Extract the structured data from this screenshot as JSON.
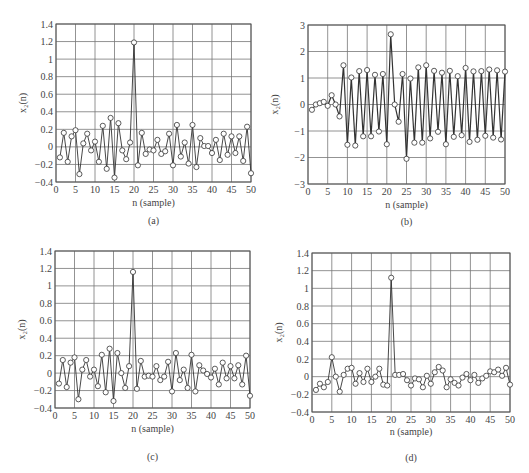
{
  "figure": {
    "panels": [
      "a",
      "b",
      "c",
      "d"
    ]
  },
  "chart_data": [
    {
      "id": "a",
      "type": "line",
      "panel_label": "(a)",
      "title": "",
      "xlabel": "n (sample)",
      "ylabel": "x₂(n)",
      "xlim": [
        0,
        50
      ],
      "ylim": [
        -0.4,
        1.4
      ],
      "xticks": [
        0,
        5,
        10,
        15,
        20,
        25,
        30,
        35,
        40,
        45,
        50
      ],
      "yticks": [
        -0.4,
        -0.2,
        0,
        0.2,
        0.4,
        0.6,
        0.8,
        1,
        1.2,
        1.4
      ],
      "ytick_labels": [
        "−0.4",
        "−0.2",
        "0",
        "0.2",
        "0.4",
        "0.6",
        "0.8",
        "1",
        "1.2",
        "1.4"
      ],
      "grid": true,
      "marker": "circle",
      "x": [
        1,
        2,
        3,
        4,
        5,
        6,
        7,
        8,
        9,
        10,
        11,
        12,
        13,
        14,
        15,
        16,
        17,
        18,
        19,
        20,
        21,
        22,
        23,
        24,
        25,
        26,
        27,
        28,
        29,
        30,
        31,
        32,
        33,
        34,
        35,
        36,
        37,
        38,
        39,
        40,
        41,
        42,
        43,
        44,
        45,
        46,
        47,
        48,
        49,
        50
      ],
      "values": [
        -0.12,
        0.16,
        -0.17,
        0.12,
        0.19,
        -0.31,
        0.04,
        0.15,
        -0.04,
        0.06,
        -0.17,
        0.24,
        -0.25,
        0.33,
        -0.35,
        0.27,
        -0.04,
        -0.14,
        0.05,
        1.19,
        -0.21,
        0.16,
        -0.08,
        -0.03,
        -0.04,
        0.08,
        -0.08,
        -0.05,
        0.15,
        -0.21,
        0.25,
        -0.11,
        0.05,
        -0.19,
        0.25,
        -0.23,
        0.1,
        0.01,
        0.01,
        -0.07,
        0.08,
        -0.15,
        0.15,
        -0.09,
        0.12,
        -0.07,
        0.12,
        -0.16,
        0.23,
        -0.3
      ]
    },
    {
      "id": "b",
      "type": "line",
      "panel_label": "(b)",
      "title": "",
      "xlabel": "n (sample)",
      "ylabel": "x₂(n)",
      "xlim": [
        0,
        50
      ],
      "ylim": [
        -3,
        3
      ],
      "xticks": [
        0,
        5,
        10,
        15,
        20,
        25,
        30,
        35,
        40,
        45,
        50
      ],
      "yticks": [
        -3,
        -2,
        -1,
        0,
        1,
        2,
        3
      ],
      "ytick_labels": [
        "−3",
        "−2",
        "−1",
        "0",
        "1",
        "2",
        "3"
      ],
      "grid": true,
      "marker": "circle",
      "x": [
        1,
        2,
        3,
        4,
        5,
        6,
        7,
        8,
        9,
        10,
        11,
        12,
        13,
        14,
        15,
        16,
        17,
        18,
        19,
        20,
        21,
        22,
        23,
        24,
        25,
        26,
        27,
        28,
        29,
        30,
        31,
        32,
        33,
        34,
        35,
        36,
        37,
        38,
        39,
        40,
        41,
        42,
        43,
        44,
        45,
        46,
        47,
        48,
        49,
        50
      ],
      "values": [
        -0.2,
        0.0,
        0.05,
        0.1,
        -0.05,
        0.35,
        0.0,
        -0.45,
        1.48,
        -1.52,
        1.02,
        -1.55,
        1.26,
        -1.2,
        1.3,
        -1.2,
        1.12,
        -1.02,
        1.15,
        -1.5,
        2.65,
        0.0,
        -0.65,
        1.15,
        -2.05,
        0.98,
        -1.44,
        1.4,
        -1.44,
        1.48,
        -1.28,
        1.27,
        -1.03,
        1.2,
        -1.5,
        1.27,
        -1.22,
        1.07,
        -1.16,
        1.38,
        -1.41,
        1.25,
        -1.33,
        1.26,
        -1.18,
        1.32,
        -1.25,
        1.29,
        -1.32,
        1.24,
        -1.3
      ]
    },
    {
      "id": "c",
      "type": "line",
      "panel_label": "(c)",
      "title": "",
      "xlabel": "n (sample)",
      "ylabel": "x₂(n)",
      "xlim": [
        0,
        50
      ],
      "ylim": [
        -0.4,
        1.4
      ],
      "xticks": [
        0,
        5,
        10,
        15,
        20,
        25,
        30,
        35,
        40,
        45,
        50
      ],
      "yticks": [
        -0.4,
        -0.2,
        0,
        0.2,
        0.4,
        0.6,
        0.8,
        1,
        1.2,
        1.4
      ],
      "ytick_labels": [
        "−0.4",
        "−0.2",
        "0",
        "0.2",
        "0.4",
        "0.6",
        "0.8",
        "1",
        "1.2",
        "1.4"
      ],
      "grid": true,
      "marker": "circle",
      "x": [
        1,
        2,
        3,
        4,
        5,
        6,
        7,
        8,
        9,
        10,
        11,
        12,
        13,
        14,
        15,
        16,
        17,
        18,
        19,
        20,
        21,
        22,
        23,
        24,
        25,
        26,
        27,
        28,
        29,
        30,
        31,
        32,
        33,
        34,
        35,
        36,
        37,
        38,
        39,
        40,
        41,
        42,
        43,
        44,
        45,
        46,
        47,
        48,
        49,
        50
      ],
      "values": [
        -0.12,
        0.15,
        -0.16,
        0.12,
        0.18,
        -0.3,
        0.04,
        0.15,
        -0.04,
        0.04,
        -0.15,
        0.21,
        -0.22,
        0.28,
        -0.32,
        0.23,
        0.0,
        -0.17,
        0.08,
        1.16,
        -0.18,
        0.14,
        -0.04,
        -0.03,
        -0.04,
        0.08,
        -0.08,
        -0.04,
        0.13,
        -0.21,
        0.23,
        -0.08,
        0.04,
        -0.17,
        0.21,
        -0.21,
        0.09,
        0.03,
        -0.01,
        -0.05,
        0.05,
        -0.13,
        0.12,
        -0.06,
        0.08,
        -0.06,
        0.09,
        -0.13,
        0.2,
        -0.26
      ]
    },
    {
      "id": "d",
      "type": "line",
      "panel_label": "(d)",
      "title": "",
      "xlabel": "n (sample)",
      "ylabel": "x₂(n)",
      "xlim": [
        0,
        50
      ],
      "ylim": [
        -0.4,
        1.4
      ],
      "xticks": [
        0,
        5,
        10,
        15,
        20,
        25,
        30,
        35,
        40,
        45,
        50
      ],
      "yticks": [
        -0.4,
        -0.2,
        0,
        0.2,
        0.4,
        0.6,
        0.8,
        1,
        1.2,
        1.4
      ],
      "ytick_labels": [
        "−0.4",
        "−0.2",
        "0",
        "0.2",
        "0.4",
        "0.6",
        "0.8",
        "1",
        "1.2",
        "1.4"
      ],
      "grid": true,
      "marker": "circle",
      "x": [
        1,
        2,
        3,
        4,
        5,
        6,
        7,
        8,
        9,
        10,
        11,
        12,
        13,
        14,
        15,
        16,
        17,
        18,
        19,
        20,
        21,
        22,
        23,
        24,
        25,
        26,
        27,
        28,
        29,
        30,
        31,
        32,
        33,
        34,
        35,
        36,
        37,
        38,
        39,
        40,
        41,
        42,
        43,
        44,
        45,
        46,
        47,
        48,
        49,
        50
      ],
      "values": [
        -0.15,
        -0.08,
        -0.12,
        -0.06,
        0.22,
        0.0,
        -0.17,
        0.02,
        0.09,
        0.1,
        -0.08,
        0.04,
        -0.06,
        0.09,
        -0.06,
        0.0,
        0.09,
        -0.09,
        -0.1,
        1.12,
        0.02,
        0.02,
        0.03,
        -0.04,
        -0.1,
        -0.02,
        -0.03,
        -0.12,
        0.01,
        -0.08,
        0.05,
        0.11,
        0.07,
        -0.12,
        -0.03,
        -0.07,
        -0.1,
        -0.01,
        0.03,
        -0.04,
        0.02,
        -0.07,
        -0.02,
        0.01,
        0.06,
        0.05,
        0.08,
        0.01,
        0.1,
        -0.09
      ]
    }
  ]
}
